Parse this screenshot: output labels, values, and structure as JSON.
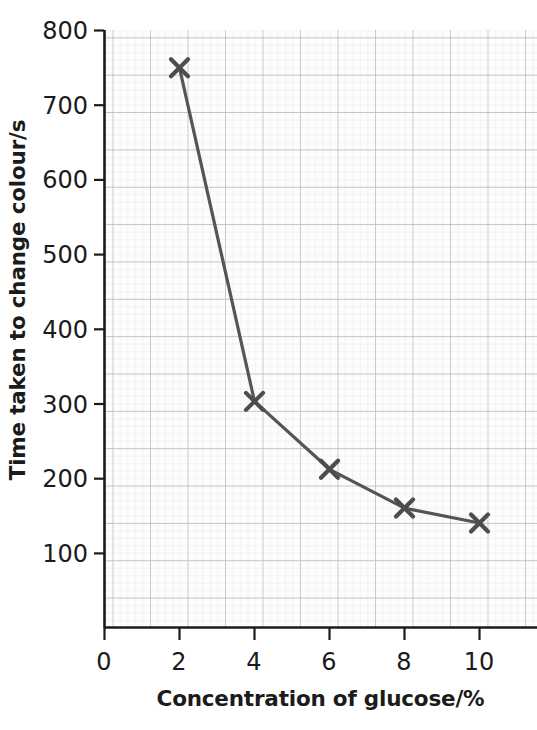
{
  "chart_data": {
    "type": "line",
    "title": "",
    "xlabel": "Concentration of glucose/%",
    "ylabel": "Time taken to change colour/s",
    "x": [
      2,
      4,
      6,
      8,
      10
    ],
    "values": [
      750,
      303,
      212,
      160,
      140
    ],
    "series": [
      {
        "name": "Time taken to change colour",
        "x": [
          2,
          4,
          6,
          8,
          10
        ],
        "values": [
          750,
          303,
          212,
          160,
          140
        ]
      }
    ],
    "xlim": [
      0,
      11.4
    ],
    "ylim": [
      0,
      800
    ],
    "xticks": [
      0,
      2,
      4,
      6,
      8,
      10
    ],
    "xtick_labels": [
      "0",
      "2",
      "4",
      "6",
      "8",
      "10"
    ],
    "yticks": [
      100,
      200,
      300,
      400,
      500,
      600,
      700,
      800
    ],
    "ytick_labels": [
      "100",
      "200",
      "300",
      "400",
      "500",
      "600",
      "700",
      "800"
    ],
    "grid": true,
    "grid_style": "graph-paper",
    "minor_grid": true,
    "legend": false,
    "legend_position": "none",
    "marker": "x-cross",
    "colors": {
      "line": "#555555",
      "marker": "#4d4d4d",
      "axis": "#1b1b1b",
      "major_grid": "#b9b9b9",
      "minor_grid": "#dcdcdc",
      "background": "#ffffff",
      "text": "#1b1b1b"
    }
  }
}
